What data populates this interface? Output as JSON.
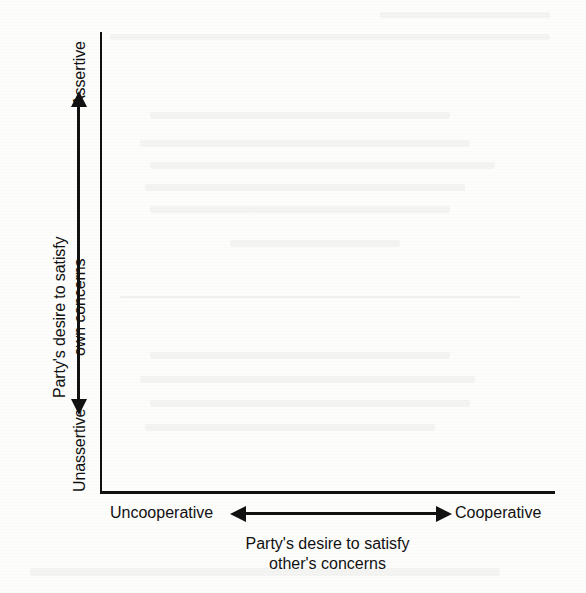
{
  "figure": {
    "type": "diagram",
    "subtype": "two-axis-conflict-style-grid",
    "axes": {
      "y": {
        "title_line1": "Party's desire to satisfy",
        "title_line2": "own concerns",
        "high_label": "Assertive",
        "low_label": "Unassertive",
        "direction": "bidirectional",
        "orientation": "vertical"
      },
      "x": {
        "title_line1": "Party's desire to satisfy",
        "title_line2": "other's concerns",
        "low_label": "Uncooperative",
        "high_label": "Cooperative",
        "direction": "bidirectional",
        "orientation": "horizontal"
      }
    },
    "plot_area": {
      "content": "",
      "gridlines": false,
      "data_points": []
    },
    "colors": {
      "ink": "#111111",
      "paper": "#fdfdfc"
    }
  }
}
